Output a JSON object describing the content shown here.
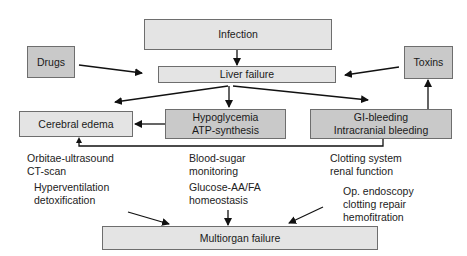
{
  "diagram": {
    "nodes": {
      "infection": {
        "label": "Infection"
      },
      "liver_failure": {
        "label": "Liver failure"
      },
      "drugs": {
        "label": "Drugs"
      },
      "toxins": {
        "label": "Toxins"
      },
      "cerebral_edema": {
        "label": "Cerebral edema"
      },
      "hypoglycemia": {
        "line1": "Hypoglycemia",
        "line2": "ATP-synthesis"
      },
      "gi_bleeding": {
        "line1": "GI-bleeding",
        "line2": "Intracranial bleeding"
      },
      "multiorgan_failure": {
        "label": "Multiorgan failure"
      }
    },
    "annotations": {
      "monitoring_cerebral": {
        "line1": "Orbitae-ultrasound",
        "line2": "CT-scan"
      },
      "treatment_cerebral": {
        "line1": "Hyperventilation",
        "line2": "detoxification"
      },
      "monitoring_hypoglycemia": {
        "line1": "Blood-sugar",
        "line2": "monitoring"
      },
      "treatment_hypoglycemia": {
        "line1": "Glucose-AA/FA",
        "line2": "homeostasis"
      },
      "monitoring_bleeding": {
        "line1": "Clotting system",
        "line2": "renal function"
      },
      "treatment_bleeding": {
        "line1": "Op. endoscopy",
        "line2": "clotting repair",
        "line3": "hemofitration"
      }
    },
    "edges": [
      {
        "from": "Infection",
        "to": "Liver failure"
      },
      {
        "from": "Drugs",
        "to": "Liver failure"
      },
      {
        "from": "Toxins",
        "to": "Liver failure"
      },
      {
        "from": "Liver failure",
        "to": "Cerebral edema"
      },
      {
        "from": "Liver failure",
        "to": "Hypoglycemia / ATP-synthesis"
      },
      {
        "from": "Liver failure",
        "to": "GI-bleeding / Intracranial bleeding"
      },
      {
        "from": "Hypoglycemia / ATP-synthesis",
        "to": "Cerebral edema"
      },
      {
        "from": "GI-bleeding / Intracranial bleeding",
        "to": "Toxins"
      },
      {
        "from": "GI-bleeding / Intracranial bleeding",
        "to": "Cerebral edema"
      },
      {
        "from": "Hyperventilation / detoxification",
        "to": "Multiorgan failure"
      },
      {
        "from": "Glucose-AA/FA homeostasis",
        "to": "Multiorgan failure"
      },
      {
        "from": "Op. endoscopy / clotting repair / hemofitration",
        "to": "Multiorgan failure"
      }
    ],
    "colors": {
      "light_box": "#e4e4e4",
      "dark_box": "#c9c9c9",
      "border": "#6e6e6e",
      "arrow": "#111111"
    }
  }
}
